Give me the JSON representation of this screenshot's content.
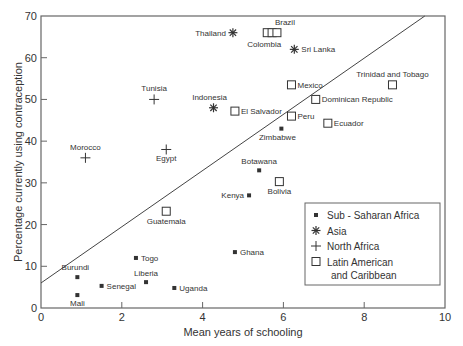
{
  "chart_data": {
    "type": "scatter",
    "title": "",
    "xlabel": "Mean years of schooling",
    "ylabel": "Percentage currently using contraception",
    "xlim": [
      0,
      10
    ],
    "ylim": [
      0,
      70
    ],
    "xticks": [
      0,
      2,
      4,
      6,
      8,
      10
    ],
    "yticks": [
      0,
      10,
      20,
      30,
      40,
      50,
      60,
      70
    ],
    "grid": false,
    "legend_position": "lower right",
    "trendline": {
      "x": [
        0,
        9.5
      ],
      "y": [
        6,
        70
      ]
    },
    "series": [
      {
        "name": "Sub - Saharan Africa",
        "marker": "filled-square",
        "points": [
          {
            "label": "Burundi",
            "x": 0.9,
            "y": 7.4,
            "lx": -2,
            "ly": -7,
            "anchor": "middle"
          },
          {
            "label": "Mali",
            "x": 0.9,
            "y": 3.1,
            "lx": 0,
            "ly": 11,
            "anchor": "middle"
          },
          {
            "label": "Senegal",
            "x": 1.5,
            "y": 5.3,
            "lx": 5,
            "ly": 3,
            "anchor": "start"
          },
          {
            "label": "Togo",
            "x": 2.35,
            "y": 12,
            "lx": 5,
            "ly": 3,
            "anchor": "start"
          },
          {
            "label": "Liberia",
            "x": 2.6,
            "y": 6.2,
            "lx": 0,
            "ly": -6,
            "anchor": "middle"
          },
          {
            "label": "Uganda",
            "x": 3.3,
            "y": 4.8,
            "lx": 5,
            "ly": 3,
            "anchor": "start"
          },
          {
            "label": "Ghana",
            "x": 4.8,
            "y": 13.4,
            "lx": 5,
            "ly": 3,
            "anchor": "start"
          },
          {
            "label": "Kenya",
            "x": 5.15,
            "y": 27,
            "lx": -5,
            "ly": 3,
            "anchor": "end"
          },
          {
            "label": "Botawana",
            "x": 5.4,
            "y": 33,
            "lx": 0,
            "ly": -6,
            "anchor": "middle"
          },
          {
            "label": "Zimbabwe",
            "x": 5.95,
            "y": 43,
            "lx": -4,
            "ly": 11,
            "anchor": "middle"
          }
        ]
      },
      {
        "name": "Asia",
        "marker": "asterisk",
        "points": [
          {
            "label": "Thailand",
            "x": 4.75,
            "y": 66,
            "lx": -7,
            "ly": 3,
            "anchor": "end"
          },
          {
            "label": "Indonesia",
            "x": 4.27,
            "y": 48,
            "lx": -4,
            "ly": -8,
            "anchor": "middle"
          },
          {
            "label": "Sri Lanka",
            "x": 6.27,
            "y": 62,
            "lx": 7,
            "ly": 3,
            "anchor": "start"
          }
        ]
      },
      {
        "name": "North Africa",
        "marker": "plus",
        "points": [
          {
            "label": "Tunisia",
            "x": 2.8,
            "y": 50,
            "lx": 0,
            "ly": -8,
            "anchor": "middle"
          },
          {
            "label": "Morocco",
            "x": 1.1,
            "y": 36,
            "lx": 0,
            "ly": -8,
            "anchor": "middle"
          },
          {
            "label": "Egypt",
            "x": 3.1,
            "y": 38,
            "lx": 0,
            "ly": 12,
            "anchor": "middle"
          }
        ]
      },
      {
        "name": "Latin American and Caribbean",
        "marker": "open-square",
        "points": [
          {
            "label": "Colombia",
            "x": 5.6,
            "y": 66,
            "lx": -3,
            "ly": 14,
            "anchor": "middle"
          },
          {
            "label": "",
            "x": 5.72,
            "y": 66,
            "lx": 0,
            "ly": 0,
            "anchor": "middle"
          },
          {
            "label": "Brazil",
            "x": 5.84,
            "y": 66,
            "lx": 8,
            "ly": -8,
            "anchor": "middle"
          },
          {
            "label": "Mexico",
            "x": 6.2,
            "y": 53.5,
            "lx": 6,
            "ly": 3,
            "anchor": "start"
          },
          {
            "label": "Dominican Republic",
            "x": 6.8,
            "y": 50,
            "lx": 6,
            "ly": 3,
            "anchor": "start"
          },
          {
            "label": "Peru",
            "x": 6.2,
            "y": 46,
            "lx": 6,
            "ly": 3,
            "anchor": "start"
          },
          {
            "label": "Ecuador",
            "x": 7.1,
            "y": 44.3,
            "lx": 6,
            "ly": 3,
            "anchor": "start"
          },
          {
            "label": "El Salvador",
            "x": 4.8,
            "y": 47.2,
            "lx": 6,
            "ly": 3,
            "anchor": "start"
          },
          {
            "label": "Trinidad and Tobago",
            "x": 8.7,
            "y": 53.5,
            "lx": 0,
            "ly": -8,
            "anchor": "middle"
          },
          {
            "label": "Bolivia",
            "x": 5.9,
            "y": 30.3,
            "lx": 0,
            "ly": 12,
            "anchor": "middle"
          },
          {
            "label": "Guatemala",
            "x": 3.1,
            "y": 23.2,
            "lx": 0,
            "ly": 13,
            "anchor": "middle"
          }
        ]
      }
    ]
  },
  "legend": {
    "items": [
      {
        "label": "Sub - Saharan Africa",
        "marker": "filled-square"
      },
      {
        "label": "Asia",
        "marker": "asterisk"
      },
      {
        "label": "North Africa",
        "marker": "plus"
      },
      {
        "label": "Latin American",
        "label2": "and Caribbean",
        "marker": "open-square"
      }
    ]
  },
  "colors": {
    "axis": "#666666",
    "marker": "#333333",
    "text": "#333333",
    "trendline": "#444444"
  }
}
